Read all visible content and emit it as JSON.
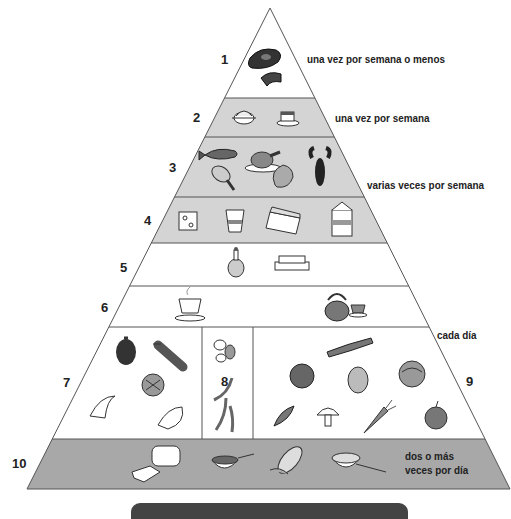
{
  "pyramid": {
    "colors": {
      "light_gray": "#d4d4d4",
      "dark_gray": "#a8a8a8",
      "white": "#ffffff",
      "outline": "#555555",
      "bar": "#444444"
    },
    "tiers": [
      {
        "number": "1",
        "frequency": "una vez por semana o menos",
        "foods": [
          "steak",
          "meat-cut"
        ],
        "fill": "white"
      },
      {
        "number": "2",
        "frequency": "una vez por semana",
        "foods": [
          "covered-dish",
          "cake-slice"
        ],
        "fill": "light_gray"
      },
      {
        "number": "3",
        "frequency": "varias veces por semana",
        "foods": [
          "fish",
          "roast-chicken",
          "chicken-leg",
          "shrimp",
          "lobster"
        ],
        "fill": "light_gray"
      },
      {
        "number": "4",
        "frequency": "",
        "foods": [
          "cheese",
          "yogurt-cup",
          "egg-carton",
          "milk-carton"
        ],
        "fill": "light_gray"
      },
      {
        "number": "5",
        "frequency": "",
        "foods": [
          "oil-cruet",
          "butter-dish"
        ],
        "fill": "white"
      },
      {
        "number": "6",
        "frequency": "",
        "foods": [
          "coffee-cup",
          "teapot",
          "teacup"
        ],
        "fill": "white"
      },
      {
        "number": "7",
        "frequency": "cada día",
        "foods": [
          "apple",
          "grapes",
          "orange-half",
          "banana",
          "orange-slice"
        ],
        "fill": "white"
      },
      {
        "number": "8",
        "frequency": "",
        "foods": [
          "beans",
          "green-beans"
        ],
        "fill": "white"
      },
      {
        "number": "9",
        "frequency": "",
        "foods": [
          "leek",
          "tomato",
          "potato",
          "cabbage",
          "pea-pod",
          "mushroom",
          "carrot",
          "onion"
        ],
        "fill": "white"
      },
      {
        "number": "10",
        "frequency": "dos o más veces por día",
        "frequency_line1": "dos o más",
        "frequency_line2": "veces por día",
        "foods": [
          "bread",
          "cereal-bowl",
          "corn",
          "rice-bowl"
        ],
        "fill": "dark_gray"
      }
    ]
  }
}
